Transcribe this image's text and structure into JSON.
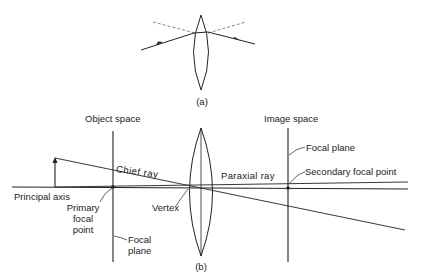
{
  "figure_a": {
    "caption": "(a)"
  },
  "figure_b": {
    "caption": "(b)",
    "labels": {
      "object_space": "Object space",
      "image_space": "Image space",
      "chief_ray": "Chief ray",
      "paraxial_ray": "Paraxial ray",
      "principal_axis": "Principal axis",
      "primary_focal_point_line1": "Primary",
      "primary_focal_point_line2": "focal",
      "primary_focal_point_line3": "point",
      "vertex": "Vertex",
      "focal_plane_left_line1": "Focal",
      "focal_plane_left_line2": "plane",
      "focal_plane_right": "Focal  plane",
      "secondary_focal_point": "Secondary focal point"
    }
  },
  "colors": {
    "line": "#222222",
    "dashed": "#666666",
    "background": "#ffffff"
  }
}
